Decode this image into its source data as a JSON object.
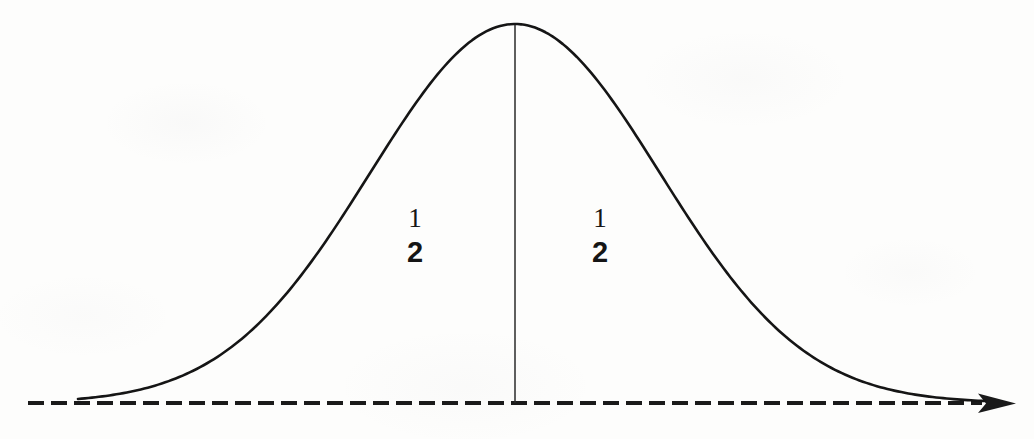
{
  "figure": {
    "background_color": "#fdfdfc",
    "ink_color": "#151515",
    "width": 1034,
    "height": 439
  },
  "labels": {
    "left_area": {
      "numerator": "1",
      "denominator": "2"
    },
    "right_area": {
      "numerator": "1",
      "denominator": "2"
    }
  },
  "chart_data": {
    "type": "line",
    "title": "",
    "subtitle": "",
    "xlabel": "",
    "ylabel": "",
    "grid": false,
    "legend_position": "none",
    "annotations": [
      {
        "text": "1/2",
        "x_px": 415,
        "y_px": 235,
        "meaning": "area of left half under the curve"
      },
      {
        "text": "1/2",
        "x_px": 600,
        "y_px": 235,
        "meaning": "area of right half under the curve"
      }
    ],
    "axis": {
      "style": "dashed",
      "arrow": "right",
      "baseline_y_px": 403,
      "start_x_px": 28,
      "end_x_px": 1015,
      "dash_length_px": 16,
      "dash_gap_px": 7,
      "stroke_width_px": 4,
      "tick_labels": []
    },
    "center_line": {
      "x_px": 515,
      "from_y_px": 24,
      "to_y_px": 403,
      "stroke_width_px": 1.5,
      "style": "solid"
    },
    "series": [
      {
        "name": "normal-curve",
        "kind": "gaussian",
        "stroke_width_px": 2.6,
        "color": "#151515",
        "peak": {
          "x_px": 515,
          "y_px": 24
        },
        "inflection_left": {
          "x_px": 370,
          "y_px": 140
        },
        "inflection_right": {
          "x_px": 660,
          "y_px": 140
        },
        "tail_left": {
          "x_px": 78,
          "y_px": 389
        },
        "tail_right": {
          "x_px": 985,
          "y_px": 400
        },
        "x": [
          78,
          120,
          165,
          210,
          255,
          300,
          345,
          370,
          400,
          440,
          475,
          515,
          555,
          590,
          630,
          660,
          690,
          735,
          780,
          825,
          870,
          915,
          955,
          985
        ],
        "y": [
          389,
          381,
          368,
          346,
          316,
          277,
          211,
          140,
          110,
          66,
          39,
          24,
          39,
          66,
          110,
          140,
          211,
          277,
          316,
          346,
          368,
          381,
          389,
          400
        ]
      }
    ],
    "xlim": [
      0,
      1034
    ],
    "ylim": [
      439,
      0
    ]
  }
}
